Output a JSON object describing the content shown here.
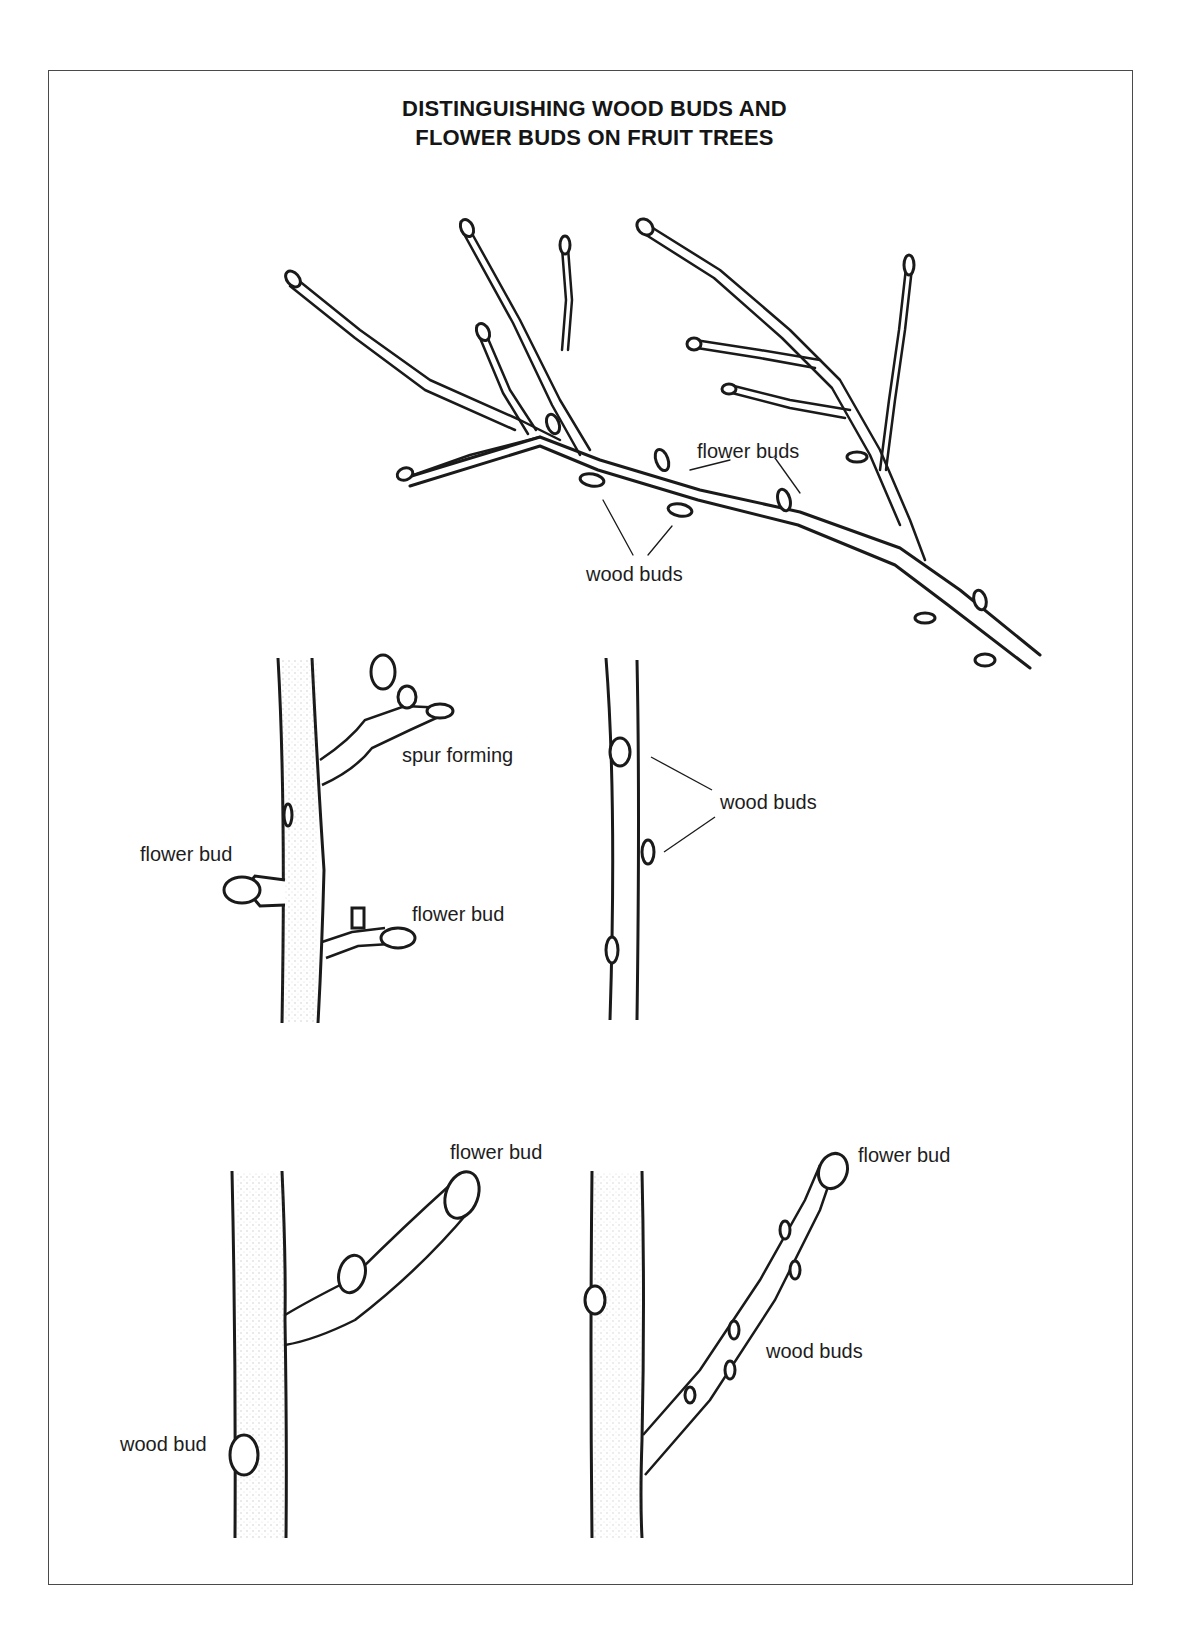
{
  "title": {
    "line1": "DISTINGUISHING WOOD BUDS AND",
    "line2": "FLOWER BUDS ON FRUIT TREES"
  },
  "figures": {
    "main_branch": {
      "labels": {
        "flower_buds": "flower buds",
        "wood_buds": "wood buds"
      }
    },
    "spur_twig": {
      "labels": {
        "spur_forming": "spur forming",
        "flower_bud_left": "flower bud",
        "flower_bud_right": "flower bud"
      }
    },
    "slender_twig": {
      "labels": {
        "wood_buds": "wood buds"
      }
    },
    "thick_shoot": {
      "labels": {
        "flower_bud": "flower bud",
        "wood_bud": "wood bud"
      }
    },
    "long_shoot": {
      "labels": {
        "flower_bud": "flower bud",
        "wood_buds": "wood buds"
      }
    }
  },
  "colors": {
    "ink": "#1a1a1a",
    "frame": "#4a4a4a",
    "background": "#ffffff"
  }
}
